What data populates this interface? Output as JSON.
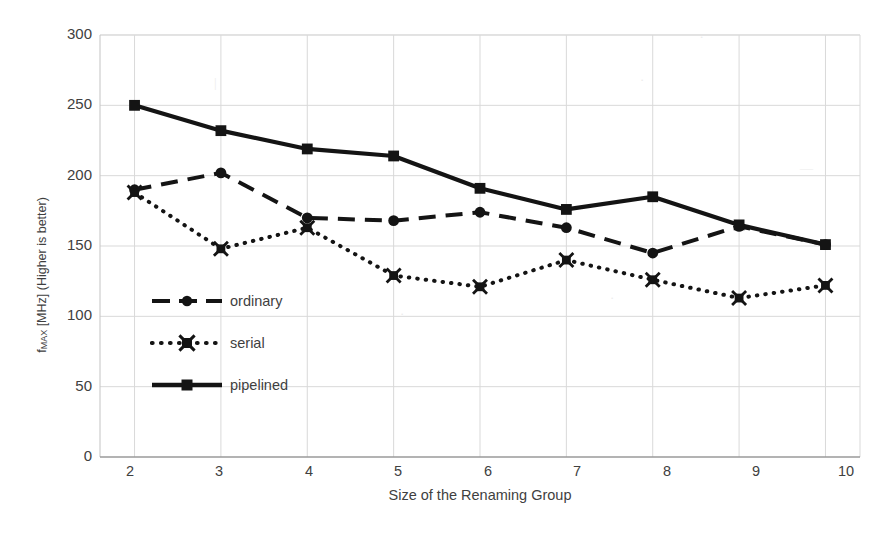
{
  "chart_data": {
    "type": "line",
    "title": "",
    "xlabel": "Size of the Renaming Group",
    "ylabel": "f_MAX [MHz] (Higher is better)",
    "ylabel_parts": {
      "pre": "f",
      "sub": "MAX",
      "post": " [MHz] (Higher is better)"
    },
    "x": [
      2,
      3,
      4,
      5,
      6,
      7,
      8,
      9,
      10
    ],
    "xticklabels": [
      "2",
      "3",
      "4",
      "5",
      "6",
      "7",
      "8",
      "9",
      "10"
    ],
    "yticklabels": [
      "0",
      "50",
      "100",
      "150",
      "200",
      "250",
      "300"
    ],
    "yticks": [
      0,
      50,
      100,
      150,
      200,
      250,
      300
    ],
    "ylim": [
      0,
      300
    ],
    "xlim": [
      1.6,
      10.4
    ],
    "grid": true,
    "legend_position": "center-left inside axes",
    "series": [
      {
        "name": "ordinary",
        "style": "dashed",
        "marker": "circle",
        "color": "#141414",
        "values": [
          190,
          202,
          170,
          168,
          174,
          163,
          145,
          164,
          151
        ]
      },
      {
        "name": "serial",
        "style": "dotted",
        "marker": "star",
        "color": "#141414",
        "values": [
          188,
          148,
          163,
          129,
          121,
          140,
          126,
          113,
          122
        ]
      },
      {
        "name": "pipelined",
        "style": "solid",
        "marker": "square",
        "color": "#141414",
        "values": [
          250,
          232,
          219,
          214,
          191,
          176,
          185,
          165,
          151
        ]
      }
    ]
  },
  "legend": {
    "items": [
      {
        "label": "ordinary",
        "key": "dashed-circle-key"
      },
      {
        "label": "serial",
        "key": "dotted-star-key"
      },
      {
        "label": "pipelined",
        "key": "solid-square-key"
      }
    ]
  },
  "axes": {
    "x_title": "Size of the Renaming Group",
    "y_title_pre": "f",
    "y_title_sub": "MAX",
    "y_title_post": " [MHz] (Higher is better)",
    "y_ticks": [
      "300",
      "250",
      "200",
      "150",
      "100",
      "50",
      "0"
    ],
    "x_ticks": [
      "2",
      "3",
      "4",
      "5",
      "6",
      "7",
      "8",
      "9",
      "10"
    ]
  },
  "colors": {
    "ink": "#141414",
    "grid": "#d9d9d9",
    "paper": "#ffffff",
    "text": "#3f3f3f"
  }
}
